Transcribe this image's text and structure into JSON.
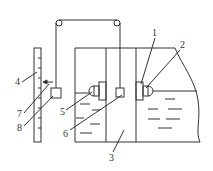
{
  "diagram": {
    "type": "mechanical schematic: float-type liquid level gauge with pulley, counterweight and scale",
    "labels": [
      {
        "id": "1",
        "text": "1",
        "x": 155,
        "y": 36
      },
      {
        "id": "2",
        "text": "2",
        "x": 182,
        "y": 48
      },
      {
        "id": "3",
        "text": "3",
        "x": 111,
        "y": 161
      },
      {
        "id": "4",
        "text": "4",
        "x": 17,
        "y": 84
      },
      {
        "id": "5",
        "text": "5",
        "x": 62,
        "y": 114
      },
      {
        "id": "6",
        "text": "6",
        "x": 66,
        "y": 135
      },
      {
        "id": "7",
        "text": "7",
        "x": 19,
        "y": 117
      },
      {
        "id": "8",
        "text": "8",
        "x": 19,
        "y": 131
      }
    ],
    "colors": {
      "line": "#333333",
      "background": "#ffffff"
    }
  }
}
